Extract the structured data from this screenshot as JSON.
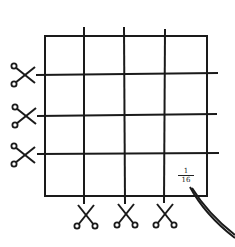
{
  "diagram": {
    "square": {
      "x": 45,
      "y": 36,
      "width": 162,
      "height": 160
    },
    "vertical_cuts": [
      84,
      124,
      164
    ],
    "horizontal_cuts": [
      74,
      115,
      154
    ],
    "grid": {
      "rows": 4,
      "cols": 4
    },
    "label": {
      "numerator": "1",
      "denominator": "16",
      "text": "1/16"
    },
    "icons": {
      "left_scissors": [
        "scissors-icon",
        "scissors-icon",
        "scissors-icon"
      ],
      "bottom_scissors": [
        "scissors-icon",
        "scissors-icon",
        "scissors-icon"
      ]
    },
    "colors": {
      "line": "#1a1a1a",
      "background": "#ffffff"
    }
  }
}
